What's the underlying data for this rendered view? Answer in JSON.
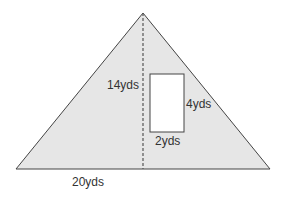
{
  "diagram": {
    "triangle": {
      "fill": "#e6e6e6",
      "stroke": "#444444",
      "height_label": "14yds",
      "base_label": "20yds"
    },
    "rectangle": {
      "fill": "#ffffff",
      "stroke": "#444444",
      "height_label": "4yds",
      "width_label": "2yds"
    }
  }
}
